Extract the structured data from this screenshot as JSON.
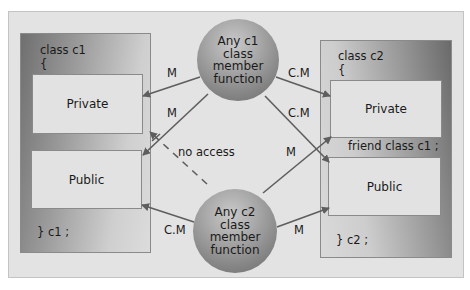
{
  "class_c1": {
    "header": "class c1",
    "open_brace": "{",
    "private_label": "Private",
    "public_label": "Public",
    "closing": "} c1 ;"
  },
  "class_c2": {
    "header": "class c2",
    "open_brace": "{",
    "private_label": "Private",
    "friend_decl": "friend class c1 ;",
    "public_label": "Public",
    "closing": "} c2 ;"
  },
  "sphere_c1": {
    "lines": [
      "Any c1",
      "class",
      "member",
      "function"
    ]
  },
  "sphere_c2": {
    "lines": [
      "Any c2",
      "class",
      "member",
      "function"
    ]
  },
  "arrow_labels": {
    "c1fn_to_c1_private": "M",
    "c1fn_to_c1_public": "M",
    "c1fn_to_c2_private": "C.M",
    "c1fn_to_c2_public": "C.M",
    "c2fn_to_c1_private_blocked": "no access",
    "c2fn_to_c2_private": "M",
    "c2fn_to_c1_public": "C.M",
    "c2fn_to_c2_public": "M"
  },
  "colors": {
    "arrow": "#5e5e5e",
    "frame_bg": "#e3e3e3",
    "member_box_bg": "#e2e2e2"
  }
}
